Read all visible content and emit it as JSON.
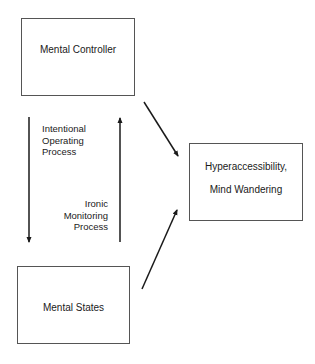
{
  "diagram": {
    "nodes": [
      {
        "id": "mental-controller",
        "label": "Mental Controller"
      },
      {
        "id": "mental-states",
        "label": "Mental States"
      },
      {
        "id": "outcome",
        "lines": [
          "Hyperaccessibility,",
          "Mind Wandering"
        ]
      }
    ],
    "edges": [
      {
        "from": "mental-controller",
        "to": "mental-states",
        "label_lines": [
          "Intentional",
          "Operating",
          "Process"
        ]
      },
      {
        "from": "mental-states",
        "to": "mental-controller",
        "label_lines": [
          "Ironic",
          "Monitoring",
          "Process"
        ]
      },
      {
        "from": "mental-controller",
        "to": "outcome"
      },
      {
        "from": "mental-states",
        "to": "outcome"
      }
    ],
    "colors": {
      "stroke": "#1a1a1a",
      "box_border": "#555555",
      "background": "#ffffff"
    }
  }
}
